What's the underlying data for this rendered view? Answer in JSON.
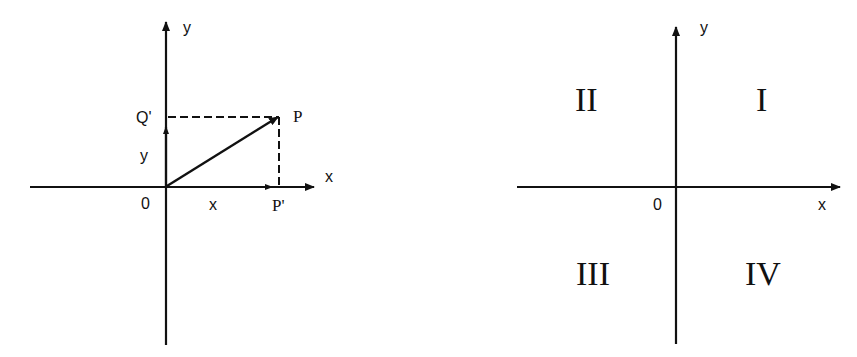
{
  "left_diagram": {
    "axis_x_label": "x",
    "axis_y_label": "y",
    "origin_label": "0",
    "point_label": "P",
    "x_projection_label": "P'",
    "y_projection_label": "Q'",
    "x_component_label": "x",
    "y_component_label": "y"
  },
  "right_diagram": {
    "axis_x_label": "x",
    "axis_y_label": "y",
    "origin_label": "0",
    "quadrants": {
      "q1": "I",
      "q2": "II",
      "q3": "III",
      "q4": "IV"
    }
  },
  "colors": {
    "ink": "#111111",
    "background": "#ffffff"
  }
}
